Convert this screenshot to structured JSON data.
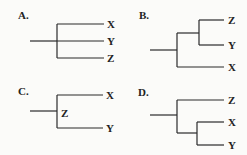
{
  "diagram": {
    "type": "phylogenetic-trees",
    "panels": [
      {
        "label": "A.",
        "topology": "(X,Y,Z) polytomy",
        "tips": [
          "X",
          "Y",
          "Z"
        ]
      },
      {
        "label": "B.",
        "topology": "((Z,Y),X)",
        "tips": [
          "Z",
          "Y",
          "X"
        ]
      },
      {
        "label": "C.",
        "topology": "Z ancestral node with children (X,Y)",
        "tips": [
          "X",
          "Y"
        ],
        "internal_label": "Z"
      },
      {
        "label": "D.",
        "topology": "(Z,(X,Y))",
        "tips": [
          "Z",
          "X",
          "Y"
        ]
      }
    ]
  }
}
